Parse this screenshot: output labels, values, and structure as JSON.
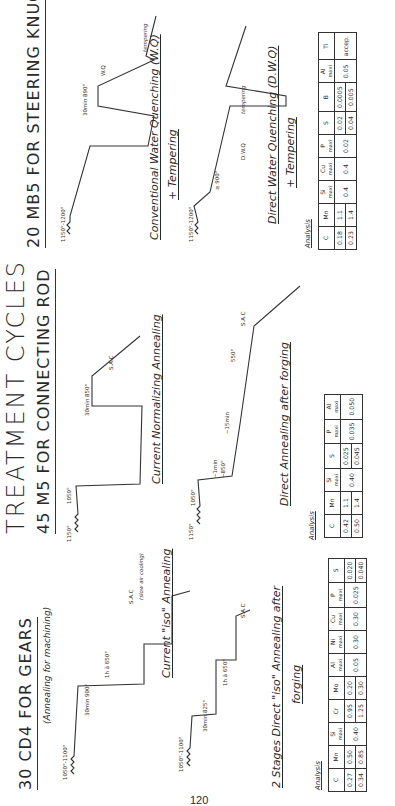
{
  "page": {
    "title": "TREATMENT CYCLES",
    "page_number": "120"
  },
  "sections": [
    {
      "heading": "30 CD4 FOR GEARS",
      "subheading": "(Annealing for machining)",
      "cycles": [
        {
          "caption": "Current \"iso\" Annealing",
          "labels": {
            "forging": "1050°-1100°",
            "hold1": "30min 900°",
            "hold2": "1h à 650°",
            "cool": "S.A.C",
            "cool_note": "(slow air cooling)"
          }
        },
        {
          "caption": "2 Stages Direct \"iso\" Annealing after forging",
          "caption_line1": "2 Stages Direct \"iso\" Annealing after",
          "caption_line2": "forging",
          "labels": {
            "forging": "1050°-1100°",
            "hold1": "30min 825°",
            "hold2": "1h à 650°",
            "cool": "S.A.C"
          }
        }
      ],
      "analysis": {
        "label": "Analysis",
        "columns": [
          {
            "el": "C",
            "maxi": false,
            "values": [
              "0.27",
              "0.34"
            ]
          },
          {
            "el": "Mn",
            "maxi": false,
            "values": [
              "0.50",
              "0.85"
            ]
          },
          {
            "el": "Si",
            "maxi": true,
            "values": [
              "0.40"
            ]
          },
          {
            "el": "Cr",
            "maxi": false,
            "values": [
              "0.95",
              "1.25"
            ]
          },
          {
            "el": "Mo",
            "maxi": false,
            "values": [
              "0.20",
              "0.30"
            ]
          },
          {
            "el": "Al",
            "maxi": true,
            "values": [
              "0.05"
            ]
          },
          {
            "el": "Ni",
            "maxi": true,
            "values": [
              "0.30"
            ]
          },
          {
            "el": "Cu",
            "maxi": true,
            "values": [
              "0.30"
            ]
          },
          {
            "el": "P",
            "maxi": true,
            "values": [
              "0.025"
            ]
          },
          {
            "el": "S",
            "maxi": false,
            "values": [
              "0.020",
              "0.040"
            ]
          }
        ]
      }
    },
    {
      "heading": "45 M5 FOR CONNECTING ROD",
      "cycles": [
        {
          "caption": "Current Normalizing Annealing",
          "labels": {
            "forging": "1150°",
            "reheat": "1050°",
            "hold1": "30min 850°",
            "cool": "S.A.C"
          }
        },
        {
          "caption": "Direct Annealing after forging",
          "labels": {
            "forging": "1150°",
            "reheat": "1050°",
            "step1": "~1min",
            "step1_temp": "~850°",
            "step2": "~15min",
            "hold": "550°",
            "cool": "S.A.C"
          }
        }
      ],
      "analysis": {
        "label": "Analysis",
        "columns": [
          {
            "el": "C",
            "maxi": false,
            "values": [
              "0.42",
              "0.50"
            ]
          },
          {
            "el": "Mn",
            "maxi": false,
            "values": [
              "1.1",
              "1.4"
            ]
          },
          {
            "el": "Si",
            "maxi": true,
            "values": [
              "0.40"
            ]
          },
          {
            "el": "S",
            "maxi": false,
            "values": [
              "0.025",
              "0.045"
            ]
          },
          {
            "el": "P",
            "maxi": true,
            "values": [
              "0.035"
            ]
          },
          {
            "el": "Al",
            "maxi": true,
            "values": [
              "0.050"
            ]
          }
        ]
      }
    },
    {
      "heading": "20 MB5 FOR STEERING KNUCKLE",
      "cycles": [
        {
          "caption": "Conventional Water Quenching (W.Q)",
          "caption_line2": "+ Tempering",
          "labels": {
            "forging": "1150°-1200°",
            "hold1": "30min 890°",
            "quench": "W.Q",
            "temper": "tempering"
          }
        },
        {
          "caption": "Direct Water Quenching (D.W.Q)",
          "caption_line2": "+ Tempering",
          "labels": {
            "forging": "1150°-1200°",
            "hold1": "≥ 900°",
            "quench": "D.W.Q",
            "temper": "tempering"
          }
        }
      ],
      "analysis": {
        "label": "Analysis",
        "columns": [
          {
            "el": "C",
            "maxi": false,
            "values": [
              "0.18",
              "0.23"
            ]
          },
          {
            "el": "Mn",
            "maxi": false,
            "values": [
              "1.1",
              "1.4"
            ]
          },
          {
            "el": "Si",
            "maxi": true,
            "values": [
              "0.4"
            ]
          },
          {
            "el": "Cu",
            "maxi": true,
            "values": [
              "0.4"
            ]
          },
          {
            "el": "P",
            "maxi": true,
            "values": [
              "0.02"
            ]
          },
          {
            "el": "S",
            "maxi": false,
            "values": [
              "0.02",
              "0.04"
            ]
          },
          {
            "el": "B",
            "maxi": false,
            "values": [
              "0.0005",
              "0.005"
            ]
          },
          {
            "el": "Al",
            "maxi": true,
            "values": [
              "0.05"
            ]
          },
          {
            "el": "Ti",
            "maxi": false,
            "values": [
              "accep."
            ]
          }
        ]
      }
    }
  ],
  "maxi_label": "maxi"
}
